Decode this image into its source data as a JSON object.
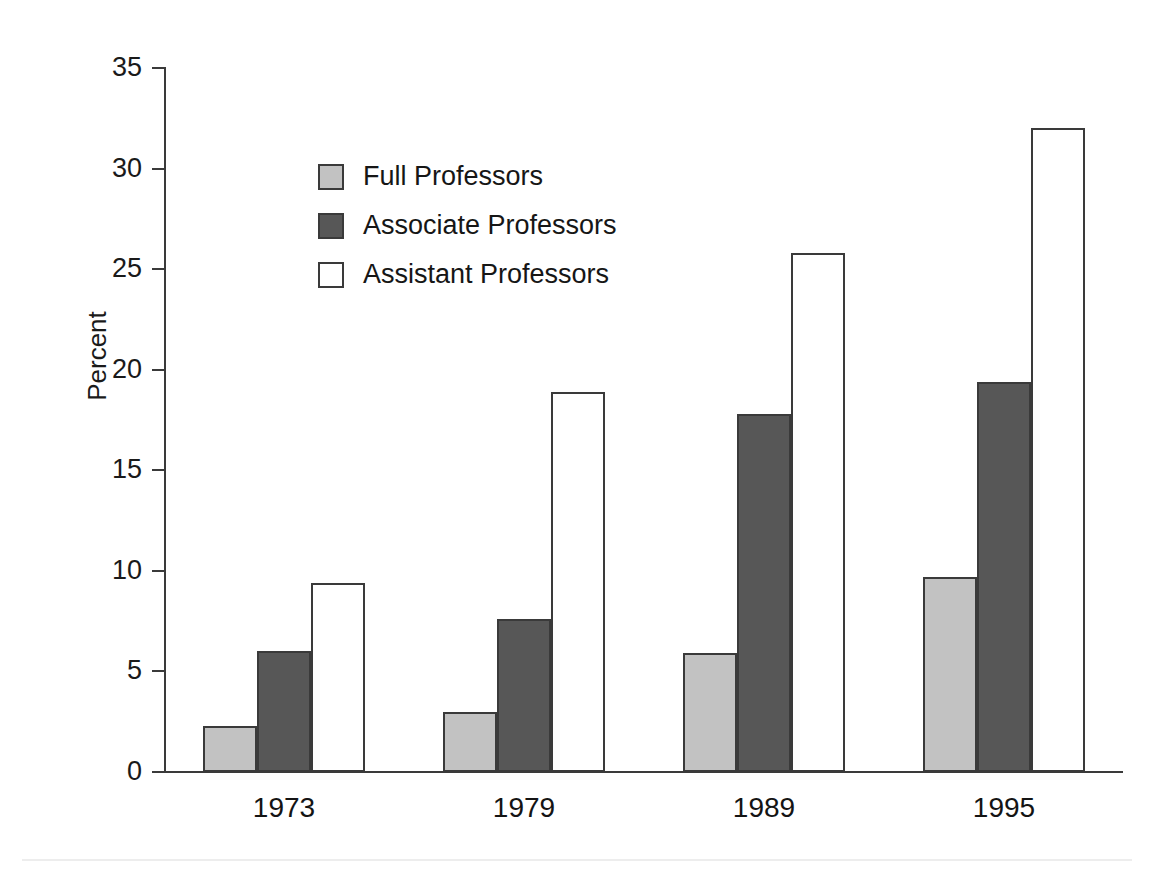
{
  "chart_data": {
    "type": "bar",
    "title": "",
    "xlabel": "",
    "ylabel": "Percent",
    "categories": [
      "1973",
      "1979",
      "1989",
      "1995"
    ],
    "ylim": [
      0,
      35
    ],
    "yticks": [
      0,
      5,
      10,
      15,
      20,
      25,
      30,
      35
    ],
    "ytick_labels": [
      "0",
      "5",
      "10",
      "15",
      "20",
      "25",
      "30",
      "35"
    ],
    "grid": false,
    "legend_position": "upper-left-inside",
    "series": [
      {
        "name": "Full Professors",
        "color": "#c2c2c2",
        "values": [
          2.3,
          3.0,
          5.9,
          9.7
        ]
      },
      {
        "name": "Associate Professors",
        "color": "#575757",
        "values": [
          6.0,
          7.6,
          17.8,
          19.4
        ]
      },
      {
        "name": "Assistant Professors",
        "color": "#ffffff",
        "values": [
          9.4,
          18.9,
          25.8,
          32.0
        ]
      }
    ]
  },
  "axis": {
    "y_title": "Percent"
  },
  "legend": {
    "items": [
      {
        "label": "Full Professors",
        "swatch": "full"
      },
      {
        "label": "Associate Professors",
        "swatch": "associate"
      },
      {
        "label": "Assistant Professors",
        "swatch": "assistant"
      }
    ]
  }
}
